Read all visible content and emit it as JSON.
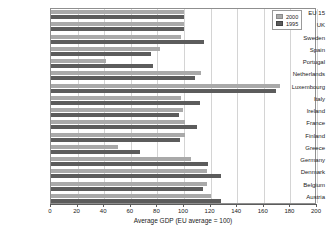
{
  "chart_data": {
    "type": "bar",
    "orientation": "horizontal",
    "title": "",
    "xlabel": "Average GDP (EU average = 100)",
    "ylabel": "",
    "xlim": [
      0,
      200
    ],
    "xticks": [
      0,
      20,
      40,
      60,
      80,
      100,
      120,
      140,
      160,
      180,
      200
    ],
    "grid": true,
    "legend_position": "top-right",
    "categories": [
      "EU 15",
      "UK",
      "Sweden",
      "Spain",
      "Portugal",
      "Netherlands",
      "Luxembourg",
      "Italy",
      "Ireland",
      "France",
      "Finland",
      "Greece",
      "Germany",
      "Denmark",
      "Belgium",
      "Austria"
    ],
    "series": [
      {
        "name": "2000",
        "color": "#a9a9a9",
        "values": [
          100,
          100,
          98,
          82,
          41,
          113,
          172,
          98,
          99,
          101,
          101,
          50,
          105,
          117,
          117,
          120
        ]
      },
      {
        "name": "1995",
        "color": "#5c5c5c",
        "values": [
          100,
          100,
          115,
          75,
          77,
          108,
          169,
          112,
          96,
          110,
          97,
          67,
          118,
          128,
          114,
          128
        ]
      }
    ]
  },
  "legend": {
    "entries": [
      {
        "label": "2000",
        "swatch": "light-gray-swatch"
      },
      {
        "label": "1995",
        "swatch": "dark-gray-swatch"
      }
    ]
  }
}
